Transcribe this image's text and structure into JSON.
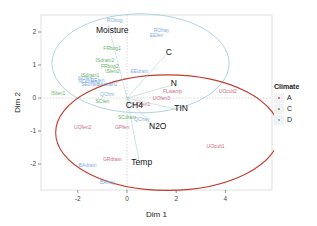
{
  "chart_data": {
    "type": "scatter",
    "title": "",
    "xlabel": "Dim 1",
    "ylabel": "Dim 2",
    "xlim": [
      -3.5,
      6
    ],
    "ylim": [
      -2.8,
      2.5
    ],
    "xticks": [
      -2,
      0,
      2,
      4
    ],
    "yticks": [
      -2,
      -1,
      0,
      1,
      2
    ],
    "legend": {
      "title": "Climate",
      "position": "right",
      "entries": [
        {
          "label": "A",
          "color": "#c0506a"
        },
        {
          "label": "C",
          "color": "#4aa84a"
        },
        {
          "label": "D",
          "color": "#6a9fd4"
        }
      ]
    },
    "variables": [
      {
        "name": "Moisture",
        "x": -0.6,
        "y": 2.05
      },
      {
        "name": "C",
        "x": 1.7,
        "y": 1.4
      },
      {
        "name": "N",
        "x": 1.9,
        "y": 0.45
      },
      {
        "name": "TIN",
        "x": 2.2,
        "y": -0.3
      },
      {
        "name": "N2O",
        "x": 1.25,
        "y": -0.85
      },
      {
        "name": "CH4",
        "x": 0.3,
        "y": -0.2
      },
      {
        "name": "Temp",
        "x": 0.6,
        "y": -1.95
      }
    ],
    "sites": [
      {
        "name": "RObog",
        "x": -0.5,
        "y": 2.3,
        "climate": "D"
      },
      {
        "name": "ROhay",
        "x": 1.4,
        "y": 2.0,
        "climate": "D"
      },
      {
        "name": "EEfen",
        "x": 1.2,
        "y": 1.85,
        "climate": "D"
      },
      {
        "name": "FRbog1",
        "x": -0.6,
        "y": 1.45,
        "climate": "C"
      },
      {
        "name": "ISdrain2",
        "x": -0.9,
        "y": 1.1,
        "climate": "C"
      },
      {
        "name": "FRbog2",
        "x": -0.7,
        "y": 0.9,
        "climate": "C"
      },
      {
        "name": "ISfen2",
        "x": -0.6,
        "y": 0.75,
        "climate": "C"
      },
      {
        "name": "ISdrain1",
        "x": -1.5,
        "y": 0.65,
        "climate": "C"
      },
      {
        "name": "EEdrain",
        "x": 0.5,
        "y": 0.75,
        "climate": "D"
      },
      {
        "name": "NOfen",
        "x": -1.7,
        "y": 0.55,
        "climate": "D"
      },
      {
        "name": "NOdrain",
        "x": -1.6,
        "y": 0.45,
        "climate": "D"
      },
      {
        "name": "DEfen",
        "x": -1.2,
        "y": 0.5,
        "climate": "D"
      },
      {
        "name": "SEdrain",
        "x": -1.5,
        "y": 0.35,
        "climate": "D"
      },
      {
        "name": "BAdrain2",
        "x": -0.8,
        "y": 0.35,
        "climate": "D"
      },
      {
        "name": "ISfen1",
        "x": -2.8,
        "y": 0.1,
        "climate": "C"
      },
      {
        "name": "QChm",
        "x": -0.8,
        "y": 0.05,
        "climate": "D"
      },
      {
        "name": "SCfen",
        "x": -1.0,
        "y": -0.15,
        "climate": "C"
      },
      {
        "name": "UOfen1",
        "x": 0.6,
        "y": -0.25,
        "climate": "A"
      },
      {
        "name": "UOfen3",
        "x": 1.4,
        "y": -0.05,
        "climate": "A"
      },
      {
        "name": "FLwamp",
        "x": 1.85,
        "y": 0.15,
        "climate": "A"
      },
      {
        "name": "UOcult2",
        "x": 4.1,
        "y": 0.15,
        "climate": "A"
      },
      {
        "name": "SCdrain",
        "x": 0.0,
        "y": -0.65,
        "climate": "C"
      },
      {
        "name": "QChay",
        "x": 0.6,
        "y": -0.7,
        "climate": "D"
      },
      {
        "name": "UOfen2",
        "x": -1.8,
        "y": -0.95,
        "climate": "A"
      },
      {
        "name": "GPfen",
        "x": -0.2,
        "y": -0.95,
        "climate": "A"
      },
      {
        "name": "GRdrain",
        "x": -0.6,
        "y": -1.9,
        "climate": "A"
      },
      {
        "name": "BAdrain",
        "x": -1.6,
        "y": -2.1,
        "climate": "D"
      },
      {
        "name": "BAhay",
        "x": -0.8,
        "y": -2.6,
        "climate": "D"
      },
      {
        "name": "UOcult1",
        "x": 3.6,
        "y": -1.5,
        "climate": "A"
      }
    ],
    "ellipses": [
      {
        "climate": "D",
        "cx": 0.55,
        "cy": 1.05,
        "rx": 3.6,
        "ry": 1.5,
        "color": "#a8cfd8"
      },
      {
        "climate": "A",
        "cx": 1.65,
        "cy": -1.05,
        "rx": 4.55,
        "ry": 1.75,
        "color": "#c23b2e"
      }
    ]
  }
}
